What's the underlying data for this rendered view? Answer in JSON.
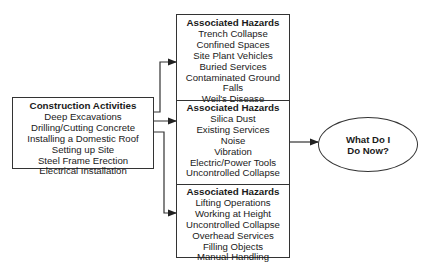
{
  "activities": {
    "title": "Construction Activities",
    "items": [
      "Deep Excavations",
      "Drilling/Cutting Concrete",
      "Installing a Domestic Roof",
      "Setting up Site",
      "Steel Frame Erection",
      "Electrical Installation"
    ]
  },
  "hazards": [
    {
      "title": "Associated Hazards",
      "items": [
        "Trench Collapse",
        "Confined Spaces",
        "Site Plant Vehicles",
        "Buried Services",
        "Contaminated Ground",
        "Falls",
        "Weil's Disease"
      ]
    },
    {
      "title": "Associated Hazards",
      "items": [
        "Silica Dust",
        "Existing Services",
        "Noise",
        "Vibration",
        "Electric/Power Tools",
        "Uncontrolled Collapse"
      ]
    },
    {
      "title": "Associated Hazards",
      "items": [
        "Lifting Operations",
        "Working at Height",
        "Uncontrolled Collapse",
        "Overhead Services",
        "Filling Objects",
        "Manual Handling"
      ]
    }
  ],
  "outcome": {
    "line1": "What Do I",
    "line2": "Do Now?"
  },
  "colors": {
    "line": "#333333",
    "text": "#1a1a1a",
    "background": "#ffffff"
  }
}
